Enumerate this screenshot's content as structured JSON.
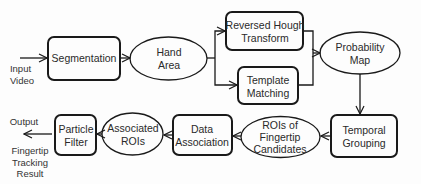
{
  "diagram": {
    "colors": {
      "stroke": "#1a1a1a",
      "text": "#2a2a2a",
      "background": "#fdfdfd"
    },
    "input_label": [
      "Input",
      "Video"
    ],
    "output_label": "Output",
    "output_result": [
      "Fingertip",
      "Tracking",
      "Result"
    ],
    "nodes": {
      "segmentation": {
        "shape": "rounded-rect",
        "lines": [
          "Segmentation"
        ]
      },
      "hand_area": {
        "shape": "ellipse",
        "lines": [
          "Hand",
          "Area"
        ]
      },
      "reversed_hough": {
        "shape": "rounded-rect",
        "lines": [
          "Reversed Hough",
          "Transform"
        ]
      },
      "template_matching": {
        "shape": "rounded-rect",
        "lines": [
          "Template",
          "Matching"
        ]
      },
      "probability_map": {
        "shape": "ellipse",
        "lines": [
          "Probability",
          "Map"
        ]
      },
      "temporal_grouping": {
        "shape": "rounded-rect",
        "lines": [
          "Temporal",
          "Grouping"
        ]
      },
      "rois_candidates": {
        "shape": "ellipse",
        "lines": [
          "ROIs of",
          "Fingertip",
          "Candidates"
        ]
      },
      "data_association": {
        "shape": "rounded-rect",
        "lines": [
          "Data",
          "Association"
        ]
      },
      "associated_rois": {
        "shape": "ellipse",
        "lines": [
          "Associated",
          "ROIs"
        ]
      },
      "particle_filter": {
        "shape": "rounded-rect",
        "lines": [
          "Particle",
          "Filter"
        ]
      }
    },
    "edges": [
      [
        "input",
        "segmentation"
      ],
      [
        "segmentation",
        "hand_area"
      ],
      [
        "hand_area",
        "reversed_hough"
      ],
      [
        "hand_area",
        "template_matching"
      ],
      [
        "reversed_hough",
        "probability_map"
      ],
      [
        "template_matching",
        "probability_map"
      ],
      [
        "probability_map",
        "temporal_grouping"
      ],
      [
        "temporal_grouping",
        "rois_candidates"
      ],
      [
        "rois_candidates",
        "data_association"
      ],
      [
        "data_association",
        "associated_rois"
      ],
      [
        "associated_rois",
        "particle_filter"
      ],
      [
        "particle_filter",
        "output"
      ]
    ]
  }
}
